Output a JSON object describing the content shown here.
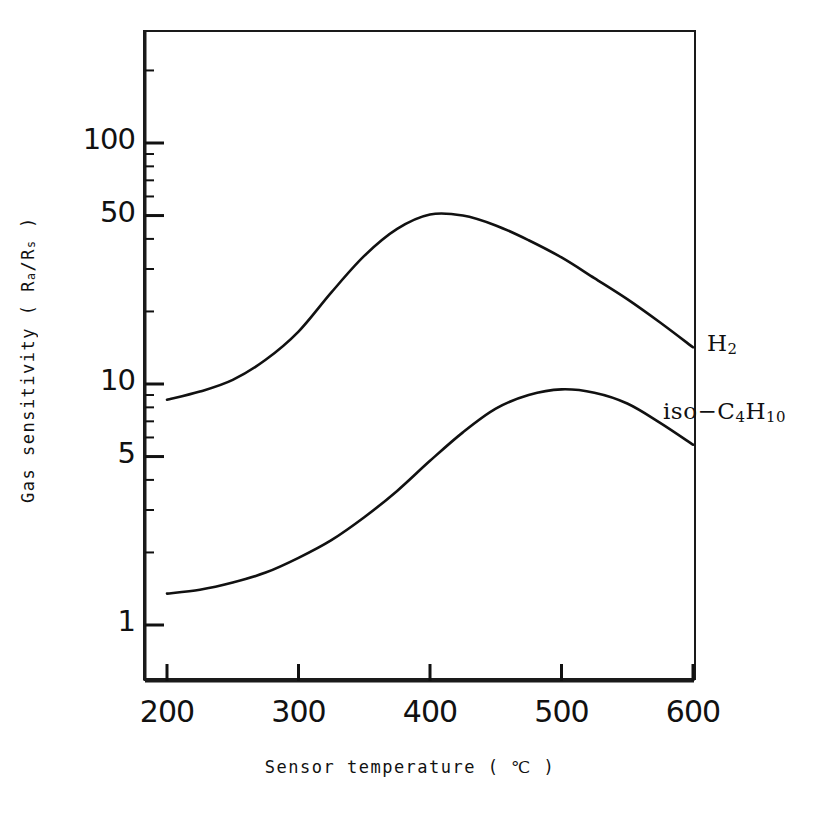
{
  "chart_data": {
    "type": "line",
    "title": "",
    "xlabel": "Sensor temperature ( ℃ )",
    "ylabel": "Gas sensitivity ( Ra/Rs )",
    "xlabel_parts": {
      "pre": "Sensor temperature ( ",
      "unit": "℃",
      "post": " )"
    },
    "ylabel_parts": {
      "pre": "Gas sensitivity ( R",
      "sub1": "a",
      "mid": "/R",
      "sub2": "s",
      "post": " )"
    },
    "xscale": "linear",
    "yscale": "log",
    "xlim": [
      200,
      600
    ],
    "ylim": [
      1,
      200
    ],
    "grid": false,
    "legend_position": "inline-right",
    "xticks": [
      200,
      300,
      400,
      500,
      600
    ],
    "xtick_labels": [
      "200",
      "300",
      "400",
      "500",
      "600"
    ],
    "yticks": [
      1,
      5,
      10,
      50,
      100
    ],
    "ytick_labels": [
      "1",
      "5",
      "10",
      "50",
      "100"
    ],
    "yminor_ticks": [
      2,
      3,
      4,
      6,
      7,
      8,
      9,
      20,
      30,
      40,
      60,
      70,
      80,
      90,
      200
    ],
    "series": [
      {
        "name": "H₂",
        "label_parts": {
          "text": "H",
          "sub": "2"
        },
        "color": "#111111",
        "x": [
          200,
          225,
          250,
          275,
          300,
          325,
          350,
          375,
          400,
          425,
          450,
          475,
          500,
          525,
          550,
          575,
          600
        ],
        "y": [
          8.6,
          9.3,
          10.4,
          12.6,
          16.5,
          24.0,
          34.0,
          44.0,
          50.5,
          50.0,
          45.5,
          39.5,
          33.5,
          27.5,
          22.5,
          18.0,
          14.2
        ]
      },
      {
        "name": "iso−C₄H₁₀",
        "label_parts": {
          "pre": "iso",
          "dash": "−",
          "c": "C",
          "sub1": "4",
          "h": "H",
          "sub2": "10"
        },
        "color": "#111111",
        "x": [
          200,
          225,
          250,
          275,
          300,
          325,
          350,
          375,
          400,
          425,
          450,
          475,
          500,
          525,
          550,
          575,
          600
        ],
        "y": [
          1.35,
          1.4,
          1.5,
          1.65,
          1.9,
          2.25,
          2.8,
          3.6,
          4.8,
          6.3,
          7.9,
          9.0,
          9.5,
          9.2,
          8.3,
          6.9,
          5.6
        ]
      }
    ]
  },
  "figure": {
    "background_color": "#ffffff",
    "line_color": "#111111",
    "frame_color": "#1a1a1a"
  }
}
